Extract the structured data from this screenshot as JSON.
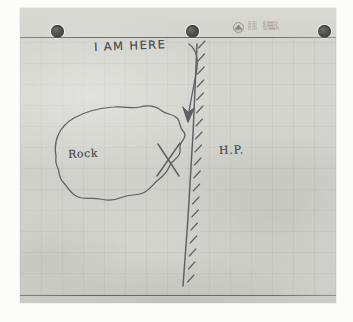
{
  "image": {
    "kind": "photograph-of-hand-drawn-sketch-map",
    "title": "Hand-drawn sketch map on hole-punched graph paper"
  },
  "sheet": {
    "name": "three-hole-punched graph paper",
    "paper_color": "#d4d4ce",
    "ink_color": "#4b4d50",
    "rule_color": "#46484a",
    "holes": [
      {
        "name": "hole-left"
      },
      {
        "name": "hole-center"
      },
      {
        "name": "hole-right"
      }
    ],
    "printed_header": {
      "logo": "circular-emblem-logo",
      "column_a": [
        "22-131",
        "22-142",
        "22-144"
      ],
      "column_b": [
        "48 SHEETS",
        "48 SHEETS",
        "100 SHEETS"
      ]
    },
    "rules": {
      "top": "top-horizontal-rule",
      "bottom": "bottom-horizontal-rule"
    }
  },
  "drawing": {
    "labels": {
      "i_am_here": "I AM HERE",
      "rock": "Rock",
      "hp": "H.P."
    },
    "marks": {
      "arrow": "curved-arrow-pointing-down",
      "x_marker": "x-mark",
      "rock_outline": "irregular-closed-blob-outline",
      "wall_line": "vertical-line-with-hatching",
      "hatching_side": "right"
    }
  }
}
